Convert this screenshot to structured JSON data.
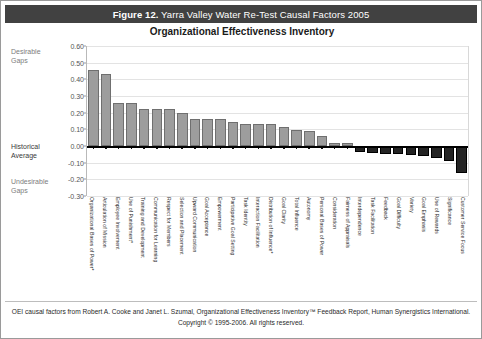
{
  "header": {
    "figure_number": "Figure 12.",
    "title": "Yarra Valley Water Re-Test Causal Factors 2005",
    "bar_color": "#414141"
  },
  "subtitle": "Organizational Effectiveness Inventory",
  "annotations": {
    "desirable": "Desirable\nGaps",
    "desirable_line1": "Desirable",
    "desirable_line2": "Gaps",
    "historical_line1": "Historical",
    "historical_line2": "Average",
    "undesirable_line1": "Undesirable",
    "undesirable_line2": "Gaps"
  },
  "footer": {
    "line1": "OEI causal factors from Robert A. Cooke and Janet L. Szumal, Organizational Effectiveness Inventory™ Feedback Report, Human Synergistics International.",
    "line2": "Copyright © 1995-2006. All rights reserved."
  },
  "colors": {
    "positive_bar": "#9d9d9d",
    "positive_border": "#6f6f6f",
    "negative_bar": "#242424",
    "zero_line": "#000000",
    "gridline": "#e3e3e3"
  },
  "chart_data": {
    "type": "bar",
    "title": "Organizational Effectiveness Inventory",
    "xlabel": "",
    "ylabel": "",
    "ylim": [
      -0.3,
      0.6
    ],
    "ytick_step": 0.1,
    "yticks": [
      "0.60",
      "0.50",
      "0.40",
      "0.30",
      "0.20",
      "0.10",
      "0.00",
      "-0.10",
      "-0.20",
      "-0.30"
    ],
    "ytick_values": [
      0.6,
      0.5,
      0.4,
      0.3,
      0.2,
      0.1,
      0.0,
      -0.1,
      -0.2,
      -0.3
    ],
    "grid": true,
    "legend": "none",
    "zero_reference_label": "Historical Average",
    "categories": [
      "Organizational Bases of Power*",
      "Articulation of Mission",
      "Employee Involvement",
      "Use of Punishment*",
      "Training and Development",
      "Communication for Learning",
      "Respect for Members",
      "Selection and Placement",
      "Upward Communication",
      "Goal Acceptance",
      "Empowerment",
      "Participative Goal Setting",
      "Task Identity",
      "Interaction Facilitation",
      "Distribution of Influence*",
      "Goal Clarity",
      "Total Influence",
      "Autonomy",
      "Personal Bases of Power",
      "Consideration",
      "Fairness of Appraisals",
      "Interdependence",
      "Task Facilitation",
      "Feedback",
      "Goal Difficulty",
      "Variety",
      "Goal Emphasis",
      "Use of Rewards",
      "Significance",
      "Customer Service Focus"
    ],
    "values": [
      0.455,
      0.43,
      0.26,
      0.26,
      0.225,
      0.225,
      0.225,
      0.2,
      0.165,
      0.165,
      0.16,
      0.145,
      0.13,
      0.13,
      0.13,
      0.115,
      0.095,
      0.09,
      0.06,
      0.02,
      0.02,
      -0.035,
      -0.04,
      -0.045,
      -0.05,
      -0.055,
      -0.06,
      -0.07,
      -0.09,
      -0.16
    ]
  }
}
